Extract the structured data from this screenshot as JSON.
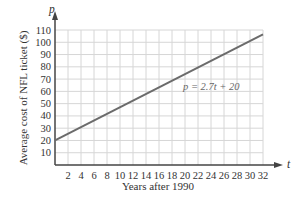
{
  "chart_data": {
    "type": "line",
    "title": "",
    "xlabel": "Years after 1990",
    "ylabel": "Average cost of NFL ticket ($)",
    "x_axis_variable": "t",
    "y_axis_variable": "p",
    "xlim": [
      0,
      32
    ],
    "ylim": [
      0,
      110
    ],
    "x_ticks": [
      2,
      4,
      6,
      8,
      10,
      12,
      14,
      16,
      18,
      20,
      22,
      24,
      26,
      28,
      30,
      32
    ],
    "x_tick_labels": [
      "2",
      "4",
      "6",
      "8",
      "10",
      "12",
      "14",
      "16",
      "18",
      "20",
      "22",
      "24",
      "26",
      "28",
      "30",
      "32"
    ],
    "y_ticks": [
      10,
      20,
      30,
      40,
      50,
      60,
      70,
      80,
      90,
      100,
      110
    ],
    "y_tick_labels": [
      "10",
      "20",
      "30",
      "40",
      "50",
      "60",
      "70",
      "80",
      "90",
      "100",
      "110"
    ],
    "grid": true,
    "legend": null,
    "annotations": [
      {
        "text": "p = 2.7t + 20",
        "x": 24,
        "y": 57
      }
    ],
    "series": [
      {
        "name": "p = 2.7t + 20",
        "x": [
          0,
          32
        ],
        "values": [
          20,
          106.4
        ],
        "color": "#6b6b6b"
      }
    ]
  },
  "labels": {
    "y_var": "p",
    "x_var": "t",
    "xlabel": "Years after 1990",
    "ylabel": "Average cost of NFL ticket ($)",
    "equation": "p = 2.7t + 20"
  },
  "colors": {
    "grid": "#d6d6d6",
    "axis": "#444444",
    "line": "#6b6b6b"
  }
}
